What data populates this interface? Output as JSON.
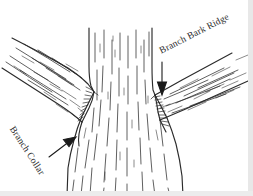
{
  "figure": {
    "width": 253,
    "height": 196,
    "background_color": "#ffffff",
    "ink_color": "#2b2b2b",
    "style": "pen-and-ink line drawing"
  },
  "labels": {
    "branch_bark_ridge": "Branch Bark Ridge",
    "branch_collar": "Branch Collar"
  },
  "annotations": [
    {
      "id": "branch-bark-ridge",
      "text": "Branch Bark Ridge",
      "rotation_deg": -27,
      "arrow_direction": "down",
      "points_to": "right branch junction"
    },
    {
      "id": "branch-collar",
      "text": "Branch Collar",
      "rotation_deg": 57,
      "arrow_direction": "up-right",
      "points_to": "left branch collar swelling"
    }
  ],
  "parts": {
    "trunk": "central vertical trunk",
    "left_branch": "branch rising to the upper left",
    "right_branch": "branch rising to the upper right"
  }
}
